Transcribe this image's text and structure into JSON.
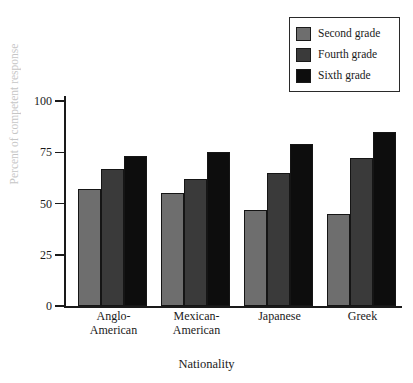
{
  "chart_data": {
    "type": "bar",
    "title": "",
    "xlabel": "Nationality",
    "ylabel": "Percent of competent response",
    "categories": [
      "Anglo-\nAmerican",
      "Mexican-\nAmerican",
      "Japanese",
      "Greek"
    ],
    "series": [
      {
        "name": "Second grade",
        "color": "#6e6e6e",
        "values": [
          57,
          55,
          47,
          45
        ]
      },
      {
        "name": "Fourth grade",
        "color": "#3a3a3a",
        "values": [
          67,
          62,
          65,
          72
        ]
      },
      {
        "name": "Sixth grade",
        "color": "#0d0d0d",
        "values": [
          73,
          75,
          79,
          85
        ]
      }
    ],
    "ylim": [
      0,
      100
    ],
    "yticks": [
      0,
      25,
      50,
      75,
      100
    ],
    "ytick_labels": [
      "0",
      "25",
      "50",
      "75",
      "100"
    ],
    "grid": false,
    "legend_position": "top-right"
  },
  "legend": {
    "entries": [
      {
        "label": "Second grade",
        "color": "#6e6e6e"
      },
      {
        "label": "Fourth grade",
        "color": "#3a3a3a"
      },
      {
        "label": "Sixth grade",
        "color": "#0d0d0d"
      }
    ]
  },
  "axes": {
    "x_title": "Nationality",
    "y_title": "Percent of competent response"
  }
}
